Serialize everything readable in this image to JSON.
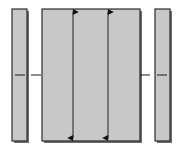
{
  "figure": {
    "canvas": {
      "width": 180,
      "height": 149,
      "background": "#ffffff"
    },
    "style": {
      "fill": "#c8c8c8",
      "stroke": "#2b2b2b",
      "shadow": "#6e6e6e",
      "arrow_color": "#111111",
      "centerline_color": "#1a1a1a",
      "stroke_width": 1.2,
      "arrow_stroke_width": 0.9,
      "centerline_stroke_width": 1.0
    },
    "shapes": [
      {
        "name": "left-side-bar",
        "kind": "rectangle",
        "x": 12,
        "y": 9,
        "width": 15,
        "height": 132,
        "fill": "#c8c8c8",
        "stroke": "#2b2b2b"
      },
      {
        "name": "center-panel",
        "kind": "rectangle",
        "x": 42,
        "y": 9,
        "width": 98,
        "height": 132,
        "fill": "#c8c8c8",
        "stroke": "#2b2b2b"
      },
      {
        "name": "right-side-bar",
        "kind": "rectangle",
        "x": 155,
        "y": 9,
        "width": 15,
        "height": 132,
        "fill": "#c8c8c8",
        "stroke": "#2b2b2b"
      }
    ],
    "dimension_arrows": [
      {
        "name": "left-dimension-arrow",
        "orientation": "vertical",
        "double_headed": true,
        "x": 73,
        "y_top": 12,
        "y_bottom": 138,
        "color": "#111111"
      },
      {
        "name": "right-dimension-arrow",
        "orientation": "vertical",
        "double_headed": true,
        "x": 108,
        "y_top": 12,
        "y_bottom": 138,
        "color": "#111111"
      }
    ],
    "centerline_marks": [
      {
        "name": "centerline-mark-left-bar",
        "x1": 15,
        "x2": 25,
        "y": 75,
        "color": "#1a1a1a"
      },
      {
        "name": "centerline-mark-left-gap",
        "x1": 31,
        "x2": 41,
        "y": 75,
        "color": "#1a1a1a"
      },
      {
        "name": "centerline-mark-right-gap",
        "x1": 140,
        "x2": 150,
        "y": 75,
        "color": "#1a1a1a"
      },
      {
        "name": "centerline-mark-right-bar",
        "x1": 157,
        "x2": 167,
        "y": 75,
        "color": "#1a1a1a"
      }
    ],
    "labels": {
      "caption": ""
    }
  }
}
